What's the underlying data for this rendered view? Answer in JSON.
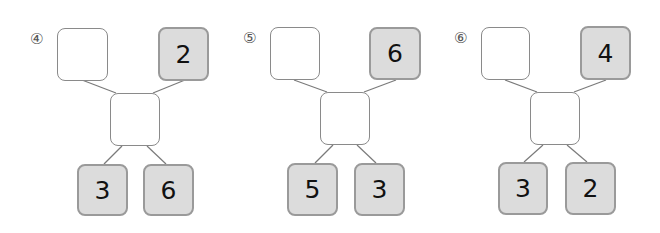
{
  "problems": [
    {
      "label": "④",
      "top_left": "",
      "top_right": "2",
      "center": "",
      "bottom_left": "3",
      "bottom_right": "6"
    },
    {
      "label": "⑤",
      "top_left": "",
      "top_right": "6",
      "center": "",
      "bottom_left": "5",
      "bottom_right": "3"
    },
    {
      "label": "⑥",
      "top_left": "",
      "top_right": "4",
      "center": "",
      "bottom_left": "3",
      "bottom_right": "2"
    }
  ],
  "colors": {
    "given_fill": "#dcdcdc",
    "given_border": "#9a9a9a",
    "empty_border": "#8a8a8a",
    "line": "#7a7a7a"
  }
}
